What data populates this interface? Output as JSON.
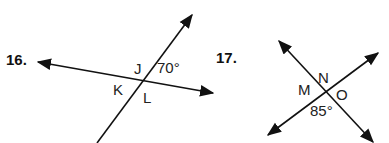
{
  "problems": [
    {
      "number": "16.",
      "labels": {
        "J": "J",
        "K": "K",
        "L": "L"
      },
      "angle": "70°"
    },
    {
      "number": "17.",
      "labels": {
        "M": "M",
        "N": "N",
        "O": "O"
      },
      "angle": "85°"
    }
  ]
}
